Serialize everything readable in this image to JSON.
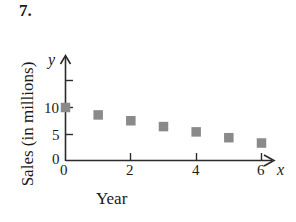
{
  "problem": {
    "number": "7."
  },
  "chart_data": {
    "type": "scatter",
    "title": "",
    "xlabel": "Year",
    "ylabel": "Sales (in millions)",
    "x": [
      0,
      1,
      2,
      3,
      4,
      5,
      6
    ],
    "values": [
      10,
      8.6,
      7.5,
      6.4,
      5.4,
      4.3,
      3.3
    ],
    "points": [
      {
        "x": 0,
        "y": 10
      },
      {
        "x": 1,
        "y": 8.6
      },
      {
        "x": 2,
        "y": 7.5
      },
      {
        "x": 3,
        "y": 6.4
      },
      {
        "x": 4,
        "y": 5.4
      },
      {
        "x": 5,
        "y": 4.3
      },
      {
        "x": 6,
        "y": 3.3
      }
    ],
    "xlim": [
      0,
      6.9
    ],
    "ylim": [
      0,
      16
    ],
    "x_ticks": [
      0,
      2,
      4,
      6
    ],
    "x_tick_labels": [
      "0",
      "2",
      "4",
      "6"
    ],
    "y_ticks": [
      0,
      5,
      10,
      15
    ],
    "y_tick_labels": [
      "0",
      "5",
      "10",
      ""
    ],
    "grid": false,
    "legend": null,
    "marker_shape": "square",
    "marker_color": "#8a8a8a",
    "axis_color": "#2b2b2b",
    "x_axis_variable": "x",
    "y_axis_variable": "y",
    "axis_arrows": true
  },
  "axis_labels": {
    "y_0": "0",
    "y_5": "5",
    "y_10": "10",
    "x_0": "0",
    "x_2": "2",
    "x_4": "4",
    "x_6": "6",
    "x_var": "x",
    "y_var": "y"
  }
}
